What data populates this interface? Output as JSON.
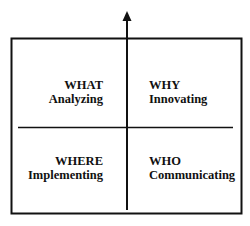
{
  "quadrants": {
    "top_left": {
      "title": "WHAT",
      "subtitle": "Analyzing"
    },
    "top_right": {
      "title": "WHY",
      "subtitle": "Innovating"
    },
    "bottom_left": {
      "title": "WHERE",
      "subtitle": "Implementing"
    },
    "bottom_right": {
      "title": "WHO",
      "subtitle": "Communicating"
    }
  },
  "colors": {
    "line": "#111111",
    "background": "#ffffff"
  }
}
